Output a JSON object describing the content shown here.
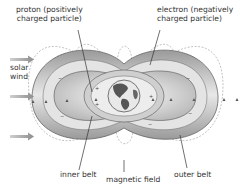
{
  "diagram": {
    "labels": {
      "proton": [
        "proton (positively",
        "charged particle)"
      ],
      "electron": [
        "electron (negatively",
        "charged particle)"
      ],
      "solar_wind": [
        "solar",
        "wind"
      ],
      "inner_belt": "inner belt",
      "magnetic_field": "magnetic field",
      "outer_belt": "outer belt"
    },
    "charges": {
      "positive": "+",
      "negative": "−"
    },
    "colors": {
      "belt_fill": "#c8c8c8",
      "belt_dark": "#8a8a8a",
      "field_line": "#9a9a9a",
      "arrow": "#8c8c8c",
      "earth_ocean": "#e8e8e8",
      "earth_land": "#555555",
      "text": "#333333"
    }
  }
}
